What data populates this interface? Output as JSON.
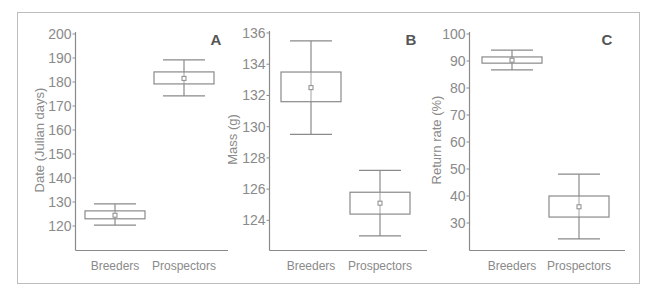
{
  "figure": {
    "frame_color": "#bdbdbd",
    "axis_color": "#8a8a8a",
    "box_color": "#8a8a8a",
    "text_color": "#8a8a8a",
    "panel_label_color": "#555555"
  },
  "chart_data": [
    {
      "type": "box",
      "panel_label": "A",
      "title": "",
      "xlabel": "",
      "ylabel": "Date (Julian days)",
      "categories": [
        "Breeders",
        "Prospectors"
      ],
      "yticks": [
        120,
        130,
        140,
        150,
        160,
        170,
        180,
        190,
        200
      ],
      "ylim": [
        110,
        200
      ],
      "grid": false,
      "series": [
        {
          "name": "Breeders",
          "whisker_low": 120.4,
          "q1": 123.0,
          "mean": 124.5,
          "q3": 126.3,
          "whisker_high": 129.2
        },
        {
          "name": "Prospectors",
          "whisker_low": 174.2,
          "q1": 179.2,
          "mean": 181.5,
          "q3": 184.2,
          "whisker_high": 189.2
        }
      ]
    },
    {
      "type": "box",
      "panel_label": "B",
      "title": "",
      "xlabel": "",
      "ylabel": "Mass (g)",
      "categories": [
        "Breeders",
        "Prospectors"
      ],
      "yticks": [
        124,
        126,
        128,
        130,
        132,
        134,
        136
      ],
      "ylim": [
        122.1,
        136
      ],
      "grid": false,
      "series": [
        {
          "name": "Breeders",
          "whisker_low": 129.5,
          "q1": 131.6,
          "mean": 132.5,
          "q3": 133.5,
          "whisker_high": 135.5
        },
        {
          "name": "Prospectors",
          "whisker_low": 123.0,
          "q1": 124.4,
          "mean": 125.1,
          "q3": 125.8,
          "whisker_high": 127.2
        }
      ]
    },
    {
      "type": "box",
      "panel_label": "C",
      "title": "",
      "xlabel": "",
      "ylabel": "Return rate (%)",
      "categories": [
        "Breeders",
        "Prospectors"
      ],
      "yticks": [
        30,
        40,
        50,
        60,
        70,
        80,
        90,
        100
      ],
      "ylim": [
        20,
        100
      ],
      "grid": false,
      "series": [
        {
          "name": "Breeders",
          "whisker_low": 86.7,
          "q1": 89.2,
          "mean": 90.3,
          "q3": 91.5,
          "whisker_high": 94.0
        },
        {
          "name": "Prospectors",
          "whisker_low": 24.1,
          "q1": 32.2,
          "mean": 36.0,
          "q3": 40.0,
          "whisker_high": 48.1
        }
      ]
    }
  ]
}
